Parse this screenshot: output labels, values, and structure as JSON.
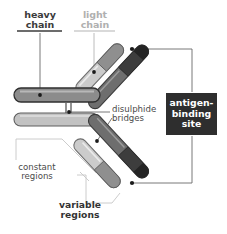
{
  "diagram": {
    "background_color": "#ffffff"
  },
  "labels": {
    "heavy_chain": {
      "line1": "heavy",
      "line2": "chain",
      "text": "heavy\nchain",
      "color": "#3b3b3b",
      "underline_color": "#3b3b3b"
    },
    "light_chain": {
      "line1": "light",
      "line2": "chain",
      "text": "light\nchain",
      "color": "#b0b0b0",
      "underline_color": "#c9c9c9"
    },
    "disulphide_bridges": {
      "line1": "disulphide",
      "line2": "bridges",
      "text": "disulphide\nbridges",
      "color": "#4a4a4a"
    },
    "constant_regions": {
      "line1": "constant",
      "line2": "regions",
      "text": "constant\nregions",
      "color": "#4a4a4a"
    },
    "variable_regions": {
      "line1": "variable",
      "line2": "regions",
      "text": "variable\nregions",
      "color": "#333333"
    },
    "antigen_binding_site": {
      "line1": "antigen-",
      "line2": "binding",
      "line3": "site",
      "text": "antigen-binding site",
      "text_color": "#ffffff",
      "box_color": "#2e2e2e"
    }
  },
  "colors": {
    "heavy_chain_constant": "#8c8c8c",
    "heavy_chain_variable": "#4a4a4a",
    "heavy_chain_tip": "#2e2e2e",
    "light_chain_constant": "#c6c6c6",
    "light_chain_variable": "#9a9a9a",
    "light_chain_outline": "#6e6e6e",
    "leader_line": "#6a6a6a",
    "dot": "#1a1a1a",
    "bracket": "#c0c0c0",
    "background": "#ffffff"
  },
  "structure": {
    "chains": [
      {
        "name": "heavy-chain-upper-left-arm",
        "chain_type": "heavy",
        "region": "constant"
      },
      {
        "name": "heavy-chain-upper-right-arm",
        "chain_type": "heavy",
        "region": "variable"
      },
      {
        "name": "heavy-chain-lower-left-arm",
        "chain_type": "heavy",
        "region": "constant"
      },
      {
        "name": "heavy-chain-lower-right-arm",
        "chain_type": "heavy",
        "region": "variable"
      },
      {
        "name": "light-chain-upper",
        "chain_type": "light",
        "region": "variable"
      },
      {
        "name": "light-chain-lower",
        "chain_type": "light",
        "region": "variable"
      }
    ],
    "disulphide_bridge_count": 2,
    "antigen_binding_site_count": 2
  }
}
